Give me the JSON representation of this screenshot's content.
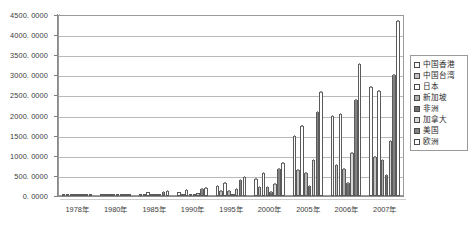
{
  "chart_data": {
    "type": "bar",
    "title": "",
    "xlabel": "",
    "ylabel": "",
    "ylim": [
      0,
      4500
    ],
    "ytick_step": 500,
    "grid": true,
    "legend_position": "right",
    "ytick_labels": [
      "4500. 0000",
      "4000. 0000",
      "3500. 0000",
      "3000. 0000",
      "2500. 0000",
      "2000. 0000",
      "1500. 0000",
      "1000. 0000",
      "500. 0000",
      "0. 0000"
    ],
    "categories": [
      "1978年",
      "1980年",
      "1985年",
      "1990年",
      "1995年",
      "2000年",
      "2005年",
      "2006年",
      "2007年"
    ],
    "series": [
      {
        "name": "中国香港",
        "color": "#fbfbfb",
        "values": [
          12,
          18,
          60,
          90,
          240,
          420,
          1500,
          1980,
          2700
        ]
      },
      {
        "name": "中国台湾",
        "color": "#c2c2c2",
        "values": [
          4,
          7,
          25,
          45,
          130,
          220,
          640,
          760,
          960
        ]
      },
      {
        "name": "日本",
        "color": "#ffffff",
        "values": [
          14,
          22,
          95,
          150,
          330,
          560,
          1750,
          2030,
          2600
        ]
      },
      {
        "name": "新加坡",
        "color": "#b0b0b0",
        "values": [
          5,
          8,
          30,
          55,
          120,
          230,
          560,
          660,
          900
        ]
      },
      {
        "name": "非洲",
        "color": "#6f6f6f",
        "values": [
          3,
          5,
          12,
          20,
          55,
          110,
          260,
          330,
          520
        ]
      },
      {
        "name": "加拿大",
        "color": "#d8d8d8",
        "values": [
          6,
          10,
          40,
          70,
          170,
          300,
          900,
          1080,
          1380
        ]
      },
      {
        "name": "美国",
        "color": "#828282",
        "values": [
          16,
          26,
          110,
          180,
          400,
          680,
          2080,
          2380,
          3020
        ]
      },
      {
        "name": "欧洲",
        "color": "#ffffff",
        "values": [
          18,
          30,
          130,
          210,
          470,
          820,
          2580,
          3280,
          4350
        ]
      }
    ]
  },
  "legend": {
    "items": [
      {
        "label": "中国香港"
      },
      {
        "label": "中国台湾"
      },
      {
        "label": "日本"
      },
      {
        "label": "新加坡"
      },
      {
        "label": "非洲"
      },
      {
        "label": "加拿大"
      },
      {
        "label": "美国"
      },
      {
        "label": "欧洲"
      }
    ]
  }
}
